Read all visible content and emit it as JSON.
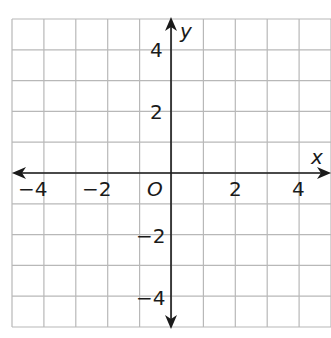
{
  "chart_data": {
    "type": "scatter",
    "title": "",
    "xlabel": "x",
    "ylabel": "y",
    "xlim": [
      -5,
      5
    ],
    "ylim": [
      -5,
      5
    ],
    "grid": true,
    "grid_step": 1,
    "origin_label": "O",
    "x_ticks": [
      {
        "value": -4,
        "label": "−4"
      },
      {
        "value": -2,
        "label": "−2"
      },
      {
        "value": 2,
        "label": "2"
      },
      {
        "value": 4,
        "label": "4"
      }
    ],
    "y_ticks": [
      {
        "value": 4,
        "label": "4"
      },
      {
        "value": 2,
        "label": "2"
      },
      {
        "value": -2,
        "label": "−2"
      },
      {
        "value": -4,
        "label": "−4"
      }
    ],
    "series": [],
    "colors": {
      "grid": "#b8b8b8",
      "axis": "#1a1a1a",
      "background": "#ffffff"
    }
  }
}
